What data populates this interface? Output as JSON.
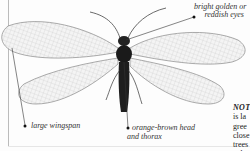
{
  "figure": {
    "callouts": {
      "eyes": {
        "line1": "bright golden or",
        "line2": "reddish eyes"
      },
      "wingspan": {
        "text": "large wingspan"
      },
      "head": {
        "line1": "orange-brown head",
        "line2": "and thorax"
      }
    }
  },
  "note": {
    "heading": "NOT",
    "lines": [
      "is la",
      "gree",
      "close",
      "trees",
      "oaks"
    ]
  }
}
